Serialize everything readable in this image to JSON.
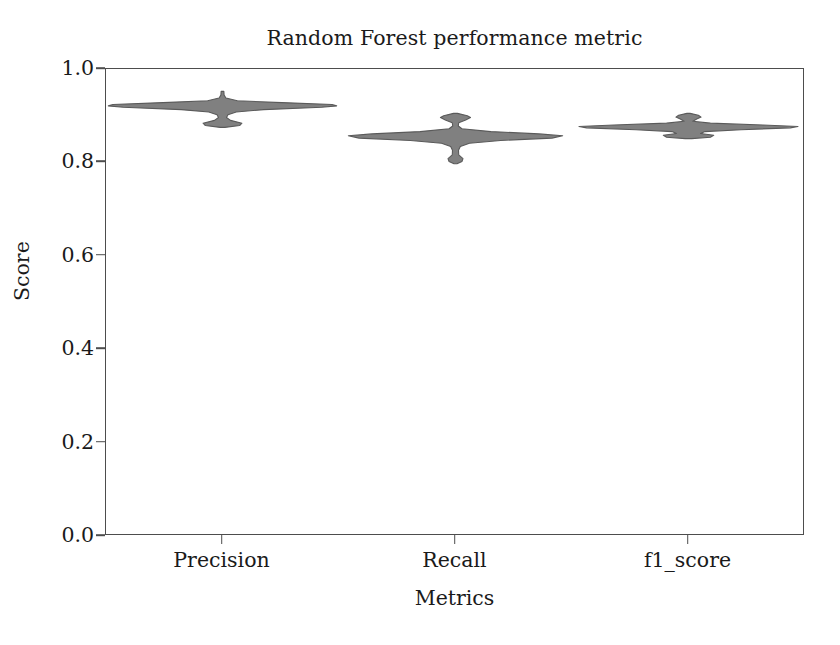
{
  "chart_data": {
    "type": "violin",
    "title": "Random Forest performance metric",
    "xlabel": "Metrics",
    "ylabel": "Score",
    "categories": [
      "Precision",
      "Recall",
      "f1_score"
    ],
    "ylim": [
      0.0,
      1.0
    ],
    "yticks": [
      "0.0",
      "0.2",
      "0.4",
      "0.6",
      "0.8",
      "1.0"
    ],
    "ytick_values": [
      0.0,
      0.2,
      0.4,
      0.6,
      0.8,
      1.0
    ],
    "grid": false,
    "legend": null,
    "fill_color": "#808080",
    "edge_color": "#5a5a5a",
    "series": [
      {
        "name": "Precision",
        "center": 0.922,
        "min": 0.875,
        "max": 0.952,
        "median": 0.922,
        "half_width_max": 0.49,
        "profile": [
          {
            "v": 0.952,
            "w": 0.012
          },
          {
            "v": 0.944,
            "w": 0.014
          },
          {
            "v": 0.938,
            "w": 0.03
          },
          {
            "v": 0.932,
            "w": 0.13
          },
          {
            "v": 0.928,
            "w": 0.52
          },
          {
            "v": 0.924,
            "w": 0.96
          },
          {
            "v": 0.921,
            "w": 1.0
          },
          {
            "v": 0.918,
            "w": 0.87
          },
          {
            "v": 0.913,
            "w": 0.36
          },
          {
            "v": 0.908,
            "w": 0.12
          },
          {
            "v": 0.902,
            "w": 0.048
          },
          {
            "v": 0.896,
            "w": 0.035
          },
          {
            "v": 0.89,
            "w": 0.07
          },
          {
            "v": 0.884,
            "w": 0.17
          },
          {
            "v": 0.879,
            "w": 0.15
          },
          {
            "v": 0.875,
            "w": 0.02
          }
        ]
      },
      {
        "name": "Recall",
        "center": 0.856,
        "min": 0.797,
        "max": 0.905,
        "median": 0.856,
        "half_width_max": 0.46,
        "profile": [
          {
            "v": 0.905,
            "w": 0.018
          },
          {
            "v": 0.9,
            "w": 0.11
          },
          {
            "v": 0.896,
            "w": 0.14
          },
          {
            "v": 0.891,
            "w": 0.095
          },
          {
            "v": 0.885,
            "w": 0.03
          },
          {
            "v": 0.878,
            "w": 0.026
          },
          {
            "v": 0.872,
            "w": 0.06
          },
          {
            "v": 0.866,
            "w": 0.33
          },
          {
            "v": 0.861,
            "w": 0.78
          },
          {
            "v": 0.857,
            "w": 1.0
          },
          {
            "v": 0.852,
            "w": 0.9
          },
          {
            "v": 0.847,
            "w": 0.42
          },
          {
            "v": 0.841,
            "w": 0.13
          },
          {
            "v": 0.834,
            "w": 0.045
          },
          {
            "v": 0.826,
            "w": 0.028
          },
          {
            "v": 0.816,
            "w": 0.03
          },
          {
            "v": 0.808,
            "w": 0.07
          },
          {
            "v": 0.802,
            "w": 0.06
          },
          {
            "v": 0.797,
            "w": 0.014
          }
        ]
      },
      {
        "name": "f1_score",
        "center": 0.876,
        "min": 0.851,
        "max": 0.905,
        "median": 0.876,
        "half_width_max": 0.47,
        "profile": [
          {
            "v": 0.905,
            "w": 0.014
          },
          {
            "v": 0.901,
            "w": 0.09
          },
          {
            "v": 0.897,
            "w": 0.115
          },
          {
            "v": 0.893,
            "w": 0.075
          },
          {
            "v": 0.888,
            "w": 0.04
          },
          {
            "v": 0.884,
            "w": 0.2
          },
          {
            "v": 0.88,
            "w": 0.68
          },
          {
            "v": 0.877,
            "w": 1.0
          },
          {
            "v": 0.874,
            "w": 0.93
          },
          {
            "v": 0.87,
            "w": 0.48
          },
          {
            "v": 0.866,
            "w": 0.15
          },
          {
            "v": 0.862,
            "w": 0.11
          },
          {
            "v": 0.858,
            "w": 0.23
          },
          {
            "v": 0.854,
            "w": 0.2
          },
          {
            "v": 0.851,
            "w": 0.03
          }
        ]
      }
    ]
  }
}
